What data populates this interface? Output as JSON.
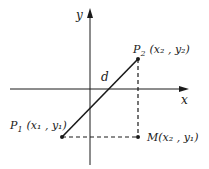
{
  "diagram": {
    "axes": {
      "x_label": "x",
      "y_label": "y"
    },
    "points": {
      "p1": {
        "name": "P",
        "sub": "1",
        "coords_label": "(x₁ , y₁)"
      },
      "p2": {
        "name": "P",
        "sub": "2",
        "coords_label": "(x₂ , y₂)"
      },
      "m": {
        "name": "M",
        "coords_label": "(x₂ , y₁)"
      }
    },
    "segment_label": "d",
    "colors": {
      "stroke": "#1a1a1a",
      "background": "#ffffff"
    }
  }
}
